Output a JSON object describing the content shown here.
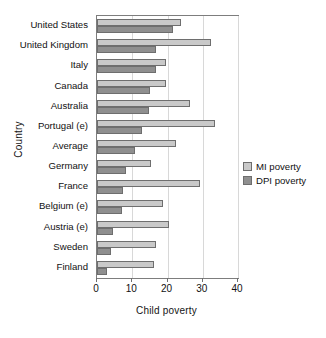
{
  "chart_data": {
    "type": "bar",
    "orientation": "horizontal",
    "title": "",
    "xlabel": "Child poverty",
    "ylabel": "Country",
    "xlim": [
      0,
      40
    ],
    "xticks": [
      0,
      10,
      20,
      30,
      40
    ],
    "xtick_labels": [
      "0",
      "10",
      "20",
      "30",
      "40"
    ],
    "grid": true,
    "legend_position": "right",
    "categories": [
      "United States",
      "United Kingdom",
      "Italy",
      "Canada",
      "Australia",
      "Portugal (e)",
      "Average",
      "Germany",
      "France",
      "Belgium (e)",
      "Austria (e)",
      "Sweden",
      "Finland"
    ],
    "series": [
      {
        "name": "MI poverty",
        "color": "#c9c9c9",
        "values": [
          23.8,
          32.3,
          19.5,
          19.5,
          26.3,
          33.4,
          22.4,
          15.3,
          29.2,
          18.7,
          20.5,
          16.8,
          16.2
        ]
      },
      {
        "name": "DPI poverty",
        "color": "#8f8f8f",
        "values": [
          21.5,
          16.7,
          16.7,
          15.0,
          14.7,
          12.7,
          10.8,
          8.2,
          7.4,
          7.0,
          4.6,
          4.0,
          2.9
        ]
      }
    ]
  },
  "legend": {
    "items": [
      {
        "label": "MI poverty"
      },
      {
        "label": "DPI poverty"
      }
    ]
  }
}
